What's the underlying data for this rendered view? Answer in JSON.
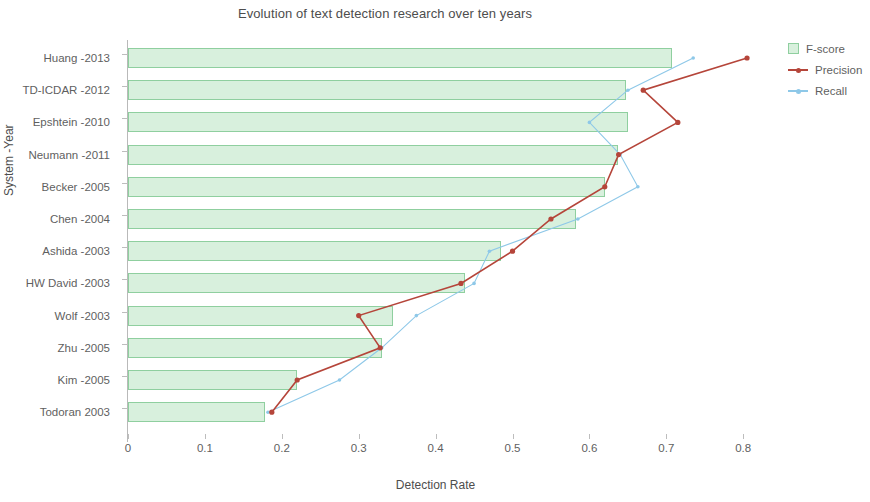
{
  "chart_data": {
    "type": "bar",
    "orientation": "horizontal",
    "title": "Evolution of text detection research over ten years",
    "xlabel": "Detection Rate",
    "ylabel": "System -Year",
    "xlim": [
      0,
      0.85
    ],
    "xticks": [
      "0",
      "0.1",
      "0.2",
      "0.3",
      "0.4",
      "0.5",
      "0.6",
      "0.7",
      "0.8"
    ],
    "xtick_values": [
      0,
      0.1,
      0.2,
      0.3,
      0.4,
      0.5,
      0.6,
      0.7,
      0.8
    ],
    "grid": false,
    "legend_position": "right",
    "categories": [
      "Huang -2013",
      "TD-ICDAR -2012",
      "Epshtein -2010",
      "Neumann -2011",
      "Becker -2005",
      "Chen -2004",
      "Ashida -2003",
      "HW David -2003",
      "Wolf -2003",
      "Zhu -2005",
      "Kim -2005",
      "Todoran 2003"
    ],
    "series": [
      {
        "name": "F-score",
        "kind": "bar",
        "color": "#d8f0dd",
        "edge_color": "#8fcf9f",
        "values": [
          0.708,
          0.648,
          0.65,
          0.637,
          0.62,
          0.583,
          0.485,
          0.438,
          0.345,
          0.33,
          0.22,
          0.178
        ]
      },
      {
        "name": "Precision",
        "kind": "line",
        "color": "#b5453a",
        "values": [
          0.805,
          0.67,
          0.715,
          0.638,
          0.62,
          0.55,
          0.5,
          0.433,
          0.3,
          0.328,
          0.22,
          0.187
        ]
      },
      {
        "name": "Recall",
        "kind": "line",
        "color": "#8ec8e8",
        "values": [
          0.735,
          0.65,
          0.6,
          0.64,
          0.663,
          0.585,
          0.47,
          0.45,
          0.375,
          0.33,
          0.275,
          0.182
        ]
      }
    ],
    "legend": [
      "F-score",
      "Precision",
      "Recall"
    ]
  }
}
